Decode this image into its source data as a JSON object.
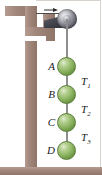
{
  "figure": {
    "colors": {
      "wall": "#a2887c",
      "sphere": "#96bb6b",
      "sphere_dark": "#4d7430",
      "rope": "#8d8d8d",
      "pulley_dark": "#2c2c34",
      "label_text": "#1b1b1b",
      "background": "#ffffff",
      "frame_line": "#d8d2cc"
    },
    "spheres": [
      {
        "id": "A",
        "label": "A",
        "cx": 67,
        "cy": 66
      },
      {
        "id": "B",
        "label": "B",
        "cx": 67,
        "cy": 94
      },
      {
        "id": "C",
        "label": "C",
        "cx": 67,
        "cy": 122
      },
      {
        "id": "D",
        "label": "D",
        "cx": 67,
        "cy": 150
      }
    ],
    "tensions": [
      {
        "id": "T1",
        "label": "T",
        "subscript": "1"
      },
      {
        "id": "T2",
        "label": "T",
        "subscript": "2"
      },
      {
        "id": "T3",
        "label": "T",
        "subscript": "3"
      }
    ],
    "pull_arrow": {
      "name": "applied-force-arrow",
      "direction": "right"
    }
  }
}
